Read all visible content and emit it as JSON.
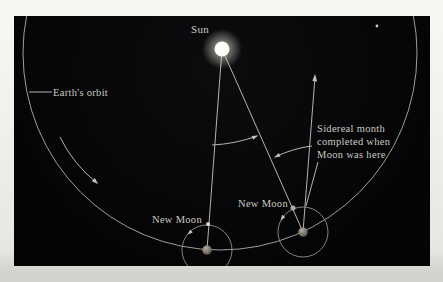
{
  "figure": {
    "type": "astronomy-diagram",
    "panel_background": "#050507",
    "page_background": "#efeeeb",
    "line_color": "#b4b4ac",
    "orbit_color": "#a6a6a0",
    "text_color": "#c9c9c0",
    "sun_color": "#fffef6",
    "earth_color": "#847c70",
    "moon_bright_color": "#e6e4d8",
    "moon_dim_color": "#aFA9A0"
  },
  "labels": {
    "sun": "Sun",
    "earths_orbit": "Earth's orbit",
    "new_moon_left": "New Moon",
    "new_moon_right": "New Moon",
    "sidereal_note": {
      "lines": [
        "Sidereal month",
        "completed when",
        "Moon was here"
      ]
    }
  },
  "icons": {
    "sun_icon": "glowing white disc at centre of Earth's orbit",
    "earth_icon": "small grey-brown planet disc (two positions)",
    "moon_icon": "tiny pale dot on moon orbit circle (two positions)",
    "distant_star_icon": "faint star dot at upper right",
    "arrow_icons": "direction arrowheads on orbit arcs and star line"
  }
}
